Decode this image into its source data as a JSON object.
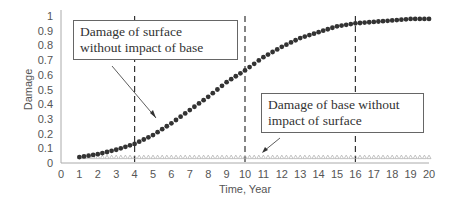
{
  "chart_data": {
    "type": "scatter",
    "title": "",
    "xlabel": "Time, Year",
    "ylabel": "Damage",
    "xlim": [
      0,
      20
    ],
    "ylim": [
      0,
      1
    ],
    "x_ticks": [
      0,
      1,
      2,
      3,
      4,
      5,
      6,
      7,
      8,
      9,
      10,
      11,
      12,
      13,
      14,
      15,
      16,
      17,
      18,
      19,
      20
    ],
    "y_ticks": [
      "0",
      "0.1",
      "0.2",
      "0.3",
      "0.4",
      "0.5",
      "0.6",
      "0.7",
      "0.8",
      "0.9",
      "1"
    ],
    "vertical_dashed_lines": [
      4,
      10,
      16
    ],
    "series": [
      {
        "name": "Damage of surface without impact of base",
        "marker": "circle",
        "color": "#333333",
        "x": [
          1,
          2,
          3,
          4,
          5,
          6,
          7,
          8,
          9,
          10,
          11,
          12,
          13,
          14,
          15,
          16,
          17,
          18,
          19,
          20
        ],
        "values": [
          0.04,
          0.06,
          0.09,
          0.13,
          0.19,
          0.27,
          0.36,
          0.45,
          0.55,
          0.63,
          0.72,
          0.79,
          0.85,
          0.89,
          0.93,
          0.95,
          0.96,
          0.97,
          0.98,
          0.98
        ]
      },
      {
        "name": "Damage of base without impact of surface",
        "marker": "triangle",
        "color": "#aaaaaa",
        "x": [
          1,
          2,
          3,
          4,
          5,
          6,
          7,
          8,
          9,
          10,
          11,
          12,
          13,
          14,
          15,
          16,
          17,
          18,
          19,
          20
        ],
        "values": [
          0.04,
          0.04,
          0.04,
          0.04,
          0.04,
          0.04,
          0.04,
          0.04,
          0.04,
          0.04,
          0.04,
          0.04,
          0.04,
          0.04,
          0.04,
          0.04,
          0.04,
          0.04,
          0.04,
          0.04
        ]
      }
    ],
    "annotations": [
      "Damage of surface without impact of base",
      "Damage of base without impact of surface"
    ]
  },
  "annotations": {
    "surface_line1": "Damage of surface",
    "surface_line2": "without impact of base",
    "base_line1": "Damage of base without",
    "base_line2": "impact of surface"
  },
  "axes": {
    "xlabel": "Time, Year",
    "ylabel": "Damage"
  }
}
